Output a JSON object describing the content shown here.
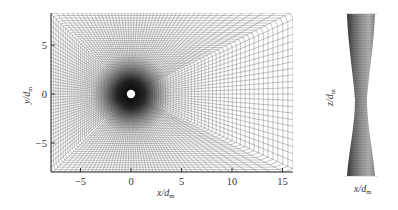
{
  "figure": {
    "left_panel": {
      "type": "computational-mesh",
      "description": "O-grid mesh around a circular cylinder, refined near the body",
      "x_axis": {
        "label_main": "x/d",
        "label_sub": "m",
        "ticks": [
          {
            "value": -5,
            "label": "−5"
          },
          {
            "value": 0,
            "label": "0"
          },
          {
            "value": 5,
            "label": "5"
          },
          {
            "value": 10,
            "label": "10"
          },
          {
            "value": 15,
            "label": "15"
          }
        ],
        "range": [
          -8,
          16
        ]
      },
      "y_axis": {
        "label_main": "y/d",
        "label_sub": "m",
        "ticks": [
          {
            "value": 5,
            "label": "5"
          },
          {
            "value": 0,
            "label": "0"
          },
          {
            "value": -5,
            "label": "−5"
          }
        ],
        "range": [
          -8,
          8
        ]
      },
      "body": {
        "shape": "circle",
        "center": [
          0,
          0
        ],
        "color": "#ffffff"
      },
      "mesh_color": "#555555"
    },
    "right_panel": {
      "type": "3d-body",
      "description": "Cylinder with variable (waisted) diameter along span",
      "z_axis": {
        "label_main": "z/d",
        "label_sub": "m"
      },
      "x_axis": {
        "label_main": "x/d",
        "label_sub": "m"
      },
      "colors": {
        "dark": "#3a3a3a",
        "mid": "#8c8c8c",
        "light": "#b8b8b8"
      }
    }
  }
}
